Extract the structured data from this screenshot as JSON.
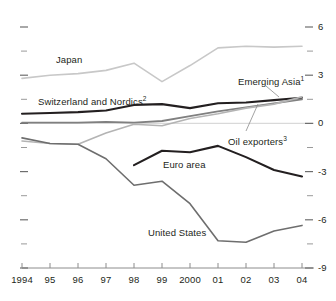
{
  "chart_data": {
    "type": "line",
    "title": "",
    "subtitle": "",
    "xlabel": "",
    "ylabel": "",
    "xlim": [
      1994,
      2004
    ],
    "ylim": [
      -9,
      6
    ],
    "grid": false,
    "zero_line": true,
    "legend_position": "inline-labels",
    "x": [
      1994,
      1995,
      1996,
      1997,
      1998,
      1999,
      2000,
      2001,
      2002,
      2003,
      2004
    ],
    "x_tick_labels": [
      "1994",
      "95",
      "96",
      "97",
      "98",
      "99",
      "2000",
      "01",
      "02",
      "03",
      "04"
    ],
    "y_ticks_major": [
      6,
      3,
      0,
      -3,
      -6,
      -9
    ],
    "y_tick_labels": [
      "6",
      "3",
      "0",
      "-3",
      "-6",
      "-9"
    ],
    "y_ticks_minor": [
      4.5,
      1.5,
      -1.5,
      -4.5,
      -7.5
    ],
    "series": [
      {
        "name": "Japan",
        "label": "Japan",
        "footnote": "",
        "color": "#c8c8c8",
        "width": 1.6,
        "x": [
          1994,
          1995,
          1996,
          1997,
          1998,
          1999,
          2000,
          2001,
          2002,
          2003,
          2004
        ],
        "values": [
          2.8,
          3.0,
          3.1,
          3.3,
          3.75,
          2.6,
          3.6,
          4.7,
          4.8,
          4.75,
          4.8
        ]
      },
      {
        "name": "Switzerland and Nordics",
        "label": "Switzerland and Nordics",
        "footnote": "2",
        "color": "#231f20",
        "width": 2.1,
        "x": [
          1994,
          1995,
          1996,
          1997,
          1998,
          1999,
          2000,
          2001,
          2002,
          2003,
          2004
        ],
        "values": [
          0.6,
          0.65,
          0.7,
          0.8,
          1.15,
          1.2,
          0.95,
          1.25,
          1.3,
          1.45,
          1.6
        ]
      },
      {
        "name": "Oil exporters",
        "label": "Oil exporters",
        "footnote": "3",
        "color": "#808080",
        "width": 1.8,
        "x": [
          1994,
          1995,
          1996,
          1997,
          1998,
          1999,
          2000,
          2001,
          2002,
          2003,
          2004
        ],
        "values": [
          0.05,
          0.05,
          0.05,
          0.1,
          0.05,
          0.15,
          0.45,
          0.75,
          1.0,
          1.25,
          1.5
        ]
      },
      {
        "name": "Emerging Asia",
        "label": "Emerging Asia",
        "footnote": "1",
        "color": "#b4b4b4",
        "width": 1.6,
        "x": [
          1994,
          1995,
          1996,
          1997,
          1998,
          1999,
          2000,
          2001,
          2002,
          2003,
          2004
        ],
        "values": [
          -1.1,
          -1.25,
          -1.3,
          -0.6,
          -0.05,
          -0.15,
          0.3,
          0.6,
          0.95,
          1.2,
          1.65
        ]
      },
      {
        "name": "Euro area",
        "label": "Euro area",
        "footnote": "",
        "color": "#231f20",
        "width": 2.1,
        "x": [
          1998,
          1999,
          2000,
          2001,
          2002,
          2003,
          2004
        ],
        "values": [
          -2.6,
          -1.7,
          -1.8,
          -1.4,
          -2.1,
          -2.9,
          -3.3
        ]
      },
      {
        "name": "United States",
        "label": "United States",
        "footnote": "",
        "color": "#6e6e6e",
        "width": 1.6,
        "x": [
          1994,
          1995,
          1996,
          1997,
          1998,
          1999,
          2000,
          2001,
          2002,
          2003,
          2004
        ],
        "values": [
          -0.9,
          -1.25,
          -1.3,
          -2.2,
          -3.85,
          -3.6,
          -5.0,
          -7.3,
          -7.4,
          -6.7,
          -6.35
        ]
      }
    ],
    "series_label_positions": [
      {
        "name": "Japan",
        "x": 56,
        "y": 54
      },
      {
        "name": "Switzerland and Nordics",
        "x": 38,
        "y": 96
      },
      {
        "name": "Emerging Asia",
        "x": 238,
        "y": 76
      },
      {
        "name": "Oil exporters",
        "x": 228,
        "y": 136
      },
      {
        "name": "Euro area",
        "x": 163,
        "y": 159
      },
      {
        "name": "United States",
        "x": 148,
        "y": 227
      }
    ]
  }
}
